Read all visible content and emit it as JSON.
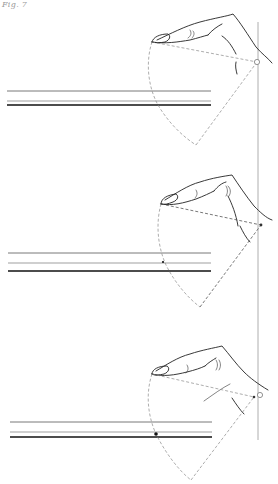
{
  "figure": {
    "caption": "Fig. 7",
    "panel_count": 3
  },
  "colors": {
    "ink": "#222222",
    "construction": "#8a8a8a",
    "background": "#ffffff"
  },
  "panels": [
    {
      "id": "panel-1",
      "description": "Hand with finger extended; dashed arc from fingertip to pivot on vertical reference line",
      "fingertip": [
        152,
        42
      ],
      "pivot": [
        257,
        62
      ],
      "pivot_style": "open-circle",
      "arc_bottom": [
        196,
        145
      ],
      "lines_y": [
        91,
        101,
        105
      ]
    },
    {
      "id": "panel-2",
      "description": "Hand with finger pressing; dashed construction lines darker",
      "fingertip": [
        161,
        204
      ],
      "pivot": [
        261,
        225
      ],
      "pivot_style": "dot",
      "arc_bottom": [
        200,
        307
      ],
      "lines_y": [
        253,
        263,
        271
      ]
    },
    {
      "id": "panel-3",
      "description": "Hand with finger lifted; black contact mark on the string lines",
      "fingertip": [
        152,
        374
      ],
      "pivot": [
        259,
        396
      ],
      "pivot_style": "open-circle-with-dot",
      "arc_bottom": [
        191,
        480
      ],
      "lines_y": [
        422,
        432,
        437
      ],
      "contact_mark": [
        156,
        434
      ]
    }
  ],
  "reference_line": {
    "x": 258,
    "y_start": 22,
    "y_end": 440
  }
}
